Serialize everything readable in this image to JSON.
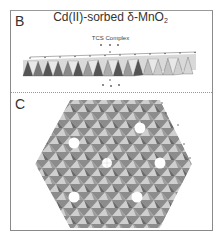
{
  "figure": {
    "title_main": "Cd(II)-sorbed δ-MnO",
    "title_sub": "2",
    "panels": [
      {
        "label": "B",
        "caption": "TCS Complex",
        "view": "side view of layered sheet"
      },
      {
        "label": "C",
        "view": "top view of hexagonal sheet with vacancies"
      }
    ]
  },
  "colors": {
    "border": "#8a8a8a",
    "octahedron_light": "#c9c9c9",
    "octahedron_dark": "#6f6f6f",
    "divider": "#999999"
  }
}
